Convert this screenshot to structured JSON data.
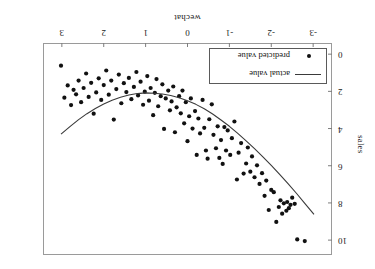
{
  "chart_data": {
    "type": "scatter",
    "title": "",
    "xlabel": "wechat",
    "ylabel": "sales",
    "xlim": [
      -3.45,
      3.45
    ],
    "ylim": [
      -0.6,
      10.8
    ],
    "xticks": [
      3,
      2,
      1,
      0,
      -1,
      -2,
      -3
    ],
    "xticklabels": [
      "3",
      "2",
      "1",
      "0",
      "-1",
      "-2",
      "-3"
    ],
    "yticks": [
      0,
      2,
      4,
      6,
      8,
      10
    ],
    "yticklabels": [
      "0",
      "2",
      "4",
      "6",
      "8",
      "10"
    ],
    "grid": false,
    "rotated_180": true,
    "legend": {
      "position": "bottom-right",
      "entries": [
        {
          "label": "predicted value",
          "marker": "dot",
          "color": "#111111"
        },
        {
          "label": "actual value",
          "marker": "line",
          "color": "#3a3a3a"
        }
      ]
    },
    "series": [
      {
        "name": "predicted value",
        "type": "scatter",
        "marker": "dot",
        "color": "#111111",
        "points": [
          [
            -3.02,
            0.35
          ],
          [
            -2.8,
            10.05
          ],
          [
            -2.62,
            9.96
          ],
          [
            -2.56,
            8.05
          ],
          [
            -2.5,
            7.72
          ],
          [
            -2.46,
            8.1
          ],
          [
            -2.42,
            8.28
          ],
          [
            -2.38,
            7.95
          ],
          [
            -2.36,
            8.42
          ],
          [
            -2.3,
            8.02
          ],
          [
            -2.26,
            8.58
          ],
          [
            -2.22,
            7.86
          ],
          [
            -2.18,
            8.22
          ],
          [
            -2.12,
            9.02
          ],
          [
            -2.06,
            7.42
          ],
          [
            -2.0,
            7.3
          ],
          [
            -1.94,
            8.38
          ],
          [
            -1.88,
            6.8
          ],
          [
            -1.84,
            7.62
          ],
          [
            -1.78,
            6.4
          ],
          [
            -1.72,
            6.98
          ],
          [
            -1.66,
            5.98
          ],
          [
            -1.6,
            6.62
          ],
          [
            -1.54,
            5.5
          ],
          [
            -1.5,
            6.32
          ],
          [
            -1.44,
            5.02
          ],
          [
            -1.4,
            5.88
          ],
          [
            -1.34,
            6.42
          ],
          [
            -1.28,
            4.78
          ],
          [
            -1.22,
            5.3
          ],
          [
            -1.18,
            6.74
          ],
          [
            -1.12,
            3.62
          ],
          [
            -1.06,
            4.52
          ],
          [
            -1.02,
            5.42
          ],
          [
            -0.96,
            4.1
          ],
          [
            -0.92,
            5.18
          ],
          [
            -0.88,
            3.92
          ],
          [
            -0.84,
            5.9
          ],
          [
            -0.8,
            4.62
          ],
          [
            -0.76,
            5.58
          ],
          [
            -0.72,
            3.88
          ],
          [
            -0.68,
            5.06
          ],
          [
            -0.62,
            4.34
          ],
          [
            -0.58,
            2.7
          ],
          [
            -0.52,
            3.5
          ],
          [
            -0.48,
            5.62
          ],
          [
            -0.44,
            5.18
          ],
          [
            -0.4,
            3.96
          ],
          [
            -0.36,
            2.46
          ],
          [
            -0.3,
            4.26
          ],
          [
            -0.26,
            3.46
          ],
          [
            -0.22,
            5.42
          ],
          [
            -0.18,
            3.06
          ],
          [
            -0.12,
            4.0
          ],
          [
            -0.08,
            2.38
          ],
          [
            -0.04,
            3.34
          ],
          [
            0.0,
            4.68
          ],
          [
            0.04,
            2.58
          ],
          [
            0.08,
            3.72
          ],
          [
            0.12,
            1.96
          ],
          [
            0.16,
            3.18
          ],
          [
            0.2,
            2.26
          ],
          [
            0.26,
            2.86
          ],
          [
            0.3,
            4.2
          ],
          [
            0.34,
            1.74
          ],
          [
            0.38,
            2.54
          ],
          [
            0.42,
            3.02
          ],
          [
            0.46,
            1.96
          ],
          [
            0.52,
            2.38
          ],
          [
            0.56,
            4.02
          ],
          [
            0.6,
            1.62
          ],
          [
            0.64,
            2.26
          ],
          [
            0.7,
            2.8
          ],
          [
            0.74,
            1.34
          ],
          [
            0.78,
            2.08
          ],
          [
            0.82,
            3.28
          ],
          [
            0.88,
            1.82
          ],
          [
            0.92,
            2.5
          ],
          [
            0.96,
            1.18
          ],
          [
            1.02,
            2.02
          ],
          [
            1.06,
            2.72
          ],
          [
            1.12,
            1.48
          ],
          [
            1.18,
            2.22
          ],
          [
            1.22,
            0.96
          ],
          [
            1.28,
            1.76
          ],
          [
            1.34,
            2.42
          ],
          [
            1.4,
            1.28
          ],
          [
            1.46,
            2.04
          ],
          [
            1.52,
            1.56
          ],
          [
            1.58,
            2.64
          ],
          [
            1.64,
            1.1
          ],
          [
            1.7,
            1.88
          ],
          [
            1.76,
            3.52
          ],
          [
            1.82,
            1.42
          ],
          [
            1.88,
            2.18
          ],
          [
            1.94,
            0.88
          ],
          [
            2.0,
            1.66
          ],
          [
            2.06,
            2.46
          ],
          [
            2.12,
            1.3
          ],
          [
            2.18,
            2.06
          ],
          [
            2.24,
            3.2
          ],
          [
            2.3,
            1.54
          ],
          [
            2.36,
            2.3
          ],
          [
            2.42,
            1.04
          ],
          [
            2.48,
            1.82
          ],
          [
            2.54,
            2.58
          ],
          [
            2.6,
            1.42
          ],
          [
            2.66,
            2.16
          ],
          [
            2.72,
            1.92
          ],
          [
            2.78,
            2.74
          ],
          [
            2.86,
            1.68
          ],
          [
            2.94,
            2.34
          ],
          [
            3.02,
            0.62
          ]
        ]
      },
      {
        "name": "actual value",
        "type": "line",
        "color": "#3a3a3a",
        "fit": "quadratic",
        "points": [
          [
            -3.02,
            8.62
          ],
          [
            -2.8,
            8.02
          ],
          [
            -2.6,
            7.48
          ],
          [
            -2.4,
            6.96
          ],
          [
            -2.2,
            6.46
          ],
          [
            -2.0,
            5.98
          ],
          [
            -1.8,
            5.52
          ],
          [
            -1.6,
            5.08
          ],
          [
            -1.4,
            4.66
          ],
          [
            -1.2,
            4.26
          ],
          [
            -1.0,
            3.88
          ],
          [
            -0.8,
            3.54
          ],
          [
            -0.6,
            3.22
          ],
          [
            -0.4,
            2.94
          ],
          [
            -0.2,
            2.7
          ],
          [
            0.0,
            2.5
          ],
          [
            0.2,
            2.34
          ],
          [
            0.4,
            2.22
          ],
          [
            0.6,
            2.14
          ],
          [
            0.8,
            2.1
          ],
          [
            1.0,
            2.08
          ],
          [
            1.2,
            2.12
          ],
          [
            1.4,
            2.2
          ],
          [
            1.6,
            2.32
          ],
          [
            1.8,
            2.48
          ],
          [
            2.0,
            2.68
          ],
          [
            2.2,
            2.92
          ],
          [
            2.4,
            3.2
          ],
          [
            2.6,
            3.52
          ],
          [
            2.8,
            3.88
          ],
          [
            3.02,
            4.3
          ]
        ]
      }
    ]
  }
}
